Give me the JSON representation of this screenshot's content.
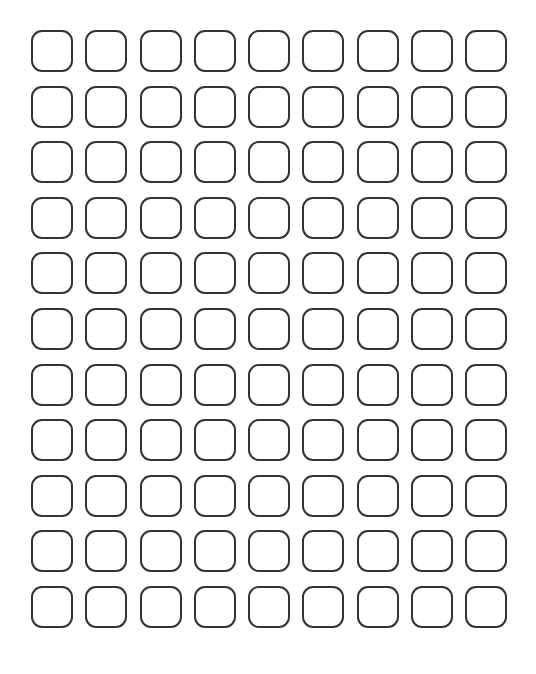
{
  "page": {
    "background_color": "#ffffff",
    "width_px": 536,
    "height_px": 674
  },
  "grid": {
    "name": "rounded-square-grid",
    "columns": 9,
    "rows": 11,
    "total_cells": 99,
    "cell_label": "",
    "cell_shape": "rounded-square",
    "cell_state": "empty",
    "cell_width_px": 42,
    "cell_height_px": 42,
    "corner_radius_px": 11,
    "column_pitch_px": 54.3,
    "row_pitch_px": 55.6,
    "margin_left_px": 31,
    "margin_top_px": 30,
    "stroke_color": "#333333",
    "stroke_width_px": 2,
    "fill_color": "transparent"
  },
  "cells": [
    [
      "",
      "",
      "",
      "",
      "",
      "",
      "",
      "",
      ""
    ],
    [
      "",
      "",
      "",
      "",
      "",
      "",
      "",
      "",
      ""
    ],
    [
      "",
      "",
      "",
      "",
      "",
      "",
      "",
      "",
      ""
    ],
    [
      "",
      "",
      "",
      "",
      "",
      "",
      "",
      "",
      ""
    ],
    [
      "",
      "",
      "",
      "",
      "",
      "",
      "",
      "",
      ""
    ],
    [
      "",
      "",
      "",
      "",
      "",
      "",
      "",
      "",
      ""
    ],
    [
      "",
      "",
      "",
      "",
      "",
      "",
      "",
      "",
      ""
    ],
    [
      "",
      "",
      "",
      "",
      "",
      "",
      "",
      "",
      ""
    ],
    [
      "",
      "",
      "",
      "",
      "",
      "",
      "",
      "",
      ""
    ],
    [
      "",
      "",
      "",
      "",
      "",
      "",
      "",
      "",
      ""
    ],
    [
      "",
      "",
      "",
      "",
      "",
      "",
      "",
      "",
      ""
    ]
  ]
}
